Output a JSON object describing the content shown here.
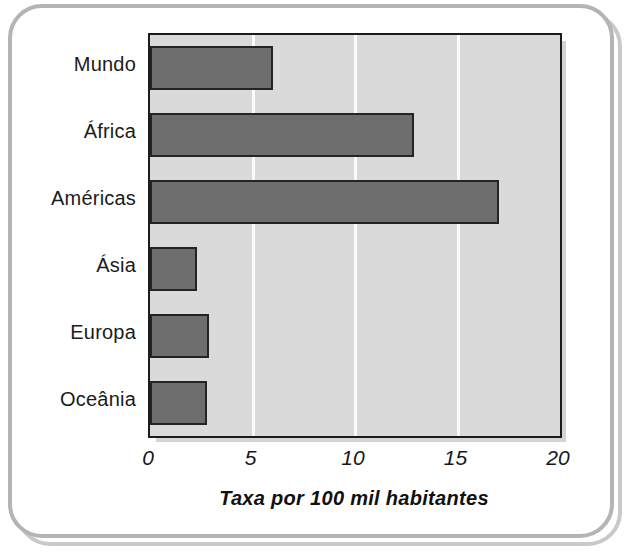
{
  "chart_data": {
    "type": "bar",
    "orientation": "horizontal",
    "title": "",
    "xlabel": "Taxa por 100 mil habitantes",
    "ylabel": "",
    "categories": [
      "Mundo",
      "África",
      "Américas",
      "Ásia",
      "Europa",
      "Oceânia"
    ],
    "values": [
      6.0,
      12.9,
      17.0,
      2.3,
      2.9,
      2.8
    ],
    "xlim": [
      0,
      20
    ],
    "xticks": [
      0,
      5,
      10,
      15,
      20
    ],
    "xtick_labels": [
      "0",
      "5",
      "10",
      "15",
      "20"
    ],
    "grid": "vertical-white-at-xticks",
    "legend": "none",
    "colors": {
      "bar_fill": "#6e6e6e",
      "bar_stroke": "#242424",
      "plot_background": "#dadada",
      "gridline": "#fbfbfb",
      "axis_line": "#1c1c1c",
      "text": "#1b1b1b",
      "frame": "#b4b4b4"
    }
  }
}
